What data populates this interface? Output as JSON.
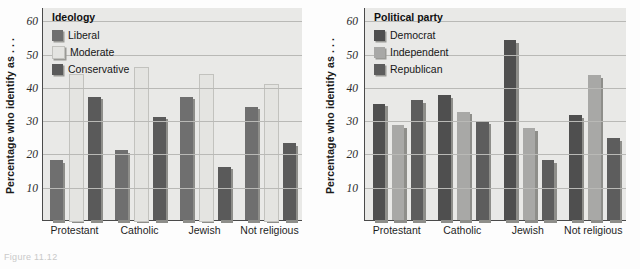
{
  "figure": {
    "caption_fragment": "Figure 11.12"
  },
  "chart_data": [
    {
      "type": "bar",
      "panel": "left",
      "title": "",
      "legend_title": "Ideology",
      "legend_position": "top-left inside plot",
      "xlabel": "",
      "ylabel": "Percentage who identify as . . .",
      "categories": [
        "Protestant",
        "Catholic",
        "Jewish",
        "Not religious"
      ],
      "ylim": [
        0,
        64
      ],
      "yticks": [
        10,
        20,
        30,
        40,
        50,
        60
      ],
      "grid": true,
      "series": [
        {
          "name": "Liberal",
          "color": "#6f6f6f",
          "values": [
            18,
            21,
            37,
            34
          ]
        },
        {
          "name": "Moderate",
          "color": "#e4e4e1",
          "values": [
            44,
            46,
            44,
            41
          ]
        },
        {
          "name": "Conservative",
          "color": "#5a5a5a",
          "values": [
            37,
            31,
            16,
            23
          ]
        }
      ]
    },
    {
      "type": "bar",
      "panel": "right",
      "title": "",
      "legend_title": "Political party",
      "legend_position": "top-left inside plot",
      "xlabel": "",
      "ylabel": "Percentage who identify as . . .",
      "categories": [
        "Protestant",
        "Catholic",
        "Jewish",
        "Not religious"
      ],
      "ylim": [
        0,
        64
      ],
      "yticks": [
        10,
        20,
        30,
        40,
        50,
        60
      ],
      "grid": true,
      "series": [
        {
          "name": "Democrat",
          "color": "#4f4f4f",
          "values": [
            35,
            37.5,
            54,
            31.5
          ]
        },
        {
          "name": "Independent",
          "color": "#a8a8a6",
          "values": [
            28.5,
            32.5,
            27.5,
            43.5
          ]
        },
        {
          "name": "Republican",
          "color": "#5d5d5d",
          "values": [
            36,
            29.5,
            18,
            24.5
          ]
        }
      ]
    }
  ]
}
